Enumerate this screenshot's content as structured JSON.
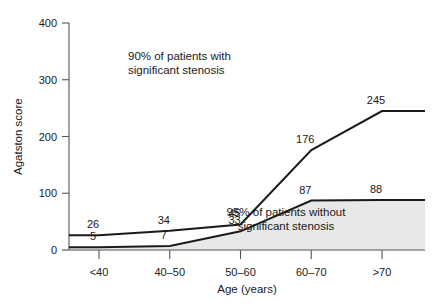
{
  "chart_data": {
    "type": "line",
    "title": "",
    "xlabel": "Age (years)",
    "ylabel": "Agatston score",
    "categories": [
      "<40",
      "40–50",
      "50–60",
      "60–70",
      ">70"
    ],
    "ylim": [
      0,
      400
    ],
    "yticks": [
      0,
      100,
      200,
      300,
      400
    ],
    "ytick_labels": [
      "0",
      "100",
      "200",
      "300",
      "400"
    ],
    "grid": false,
    "legend": "none",
    "series": [
      {
        "name": "90% of patients with significant stenosis",
        "values": [
          26,
          34,
          45,
          176,
          245
        ],
        "labels": [
          "26",
          "34",
          "45",
          "176",
          "245"
        ],
        "fill": false,
        "color": "#1a1a1a"
      },
      {
        "name": "95% of patients without significant stenosis",
        "values": [
          5,
          7,
          33,
          87,
          88
        ],
        "labels": [
          "5",
          "7",
          "33",
          "87",
          "88"
        ],
        "fill": true,
        "fill_color": "#e8e8e8",
        "color": "#1a1a1a"
      }
    ],
    "annotations": [
      {
        "id": "upper",
        "line1": "90% of patients with",
        "line2": "significant stenosis"
      },
      {
        "id": "lower",
        "line1": "95% of patients without",
        "line2": "significant stenosis"
      }
    ]
  }
}
